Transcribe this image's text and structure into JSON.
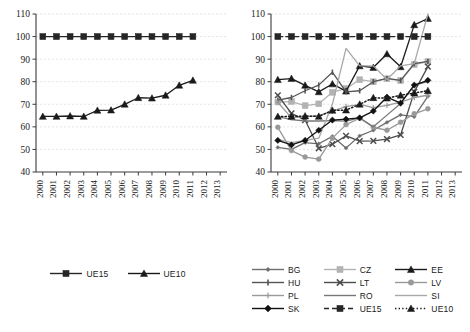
{
  "chart_data": [
    {
      "id": "left",
      "type": "line",
      "title": "",
      "xlabel": "",
      "ylabel": "",
      "x": [
        "2000",
        "2001",
        "2002",
        "2003",
        "2004",
        "2005",
        "2006",
        "2007",
        "2008",
        "2009",
        "2010",
        "2011",
        "2012",
        "2013"
      ],
      "xlim": [
        2000,
        2013
      ],
      "ylim": [
        40,
        110
      ],
      "yticks": [
        40,
        50,
        60,
        70,
        80,
        90,
        100,
        110
      ],
      "grid": true,
      "legend_position": "bottom",
      "series": [
        {
          "name": "UE15",
          "marker": "square",
          "color": "#262626",
          "dash": "solid",
          "values": [
            100,
            100,
            100,
            100,
            100,
            100,
            100,
            100,
            100,
            100,
            100,
            100,
            null,
            null
          ]
        },
        {
          "name": "UE10",
          "marker": "triangle",
          "color": "#1a1a1a",
          "dash": "solid",
          "values": [
            64.6,
            64.6,
            64.8,
            64.6,
            67.3,
            67.4,
            70.0,
            72.9,
            72.7,
            74.0,
            78.4,
            80.6,
            null,
            null
          ]
        }
      ]
    },
    {
      "id": "right",
      "type": "line",
      "title": "",
      "xlabel": "",
      "ylabel": "",
      "x": [
        "2000",
        "2001",
        "2002",
        "2003",
        "2004",
        "2005",
        "2006",
        "2007",
        "2008",
        "2009",
        "2010",
        "2011",
        "2012",
        "2013"
      ],
      "xlim": [
        2000,
        2013
      ],
      "ylim": [
        40,
        110
      ],
      "yticks": [
        40,
        50,
        60,
        70,
        80,
        90,
        100,
        110
      ],
      "grid": true,
      "legend_position": "bottom",
      "series": [
        {
          "name": "BG",
          "marker": "diamond-small",
          "color": "#6e6e6e",
          "dash": "solid",
          "values": [
            50.9,
            50.0,
            53.0,
            52.5,
            55.8,
            50.6,
            56.0,
            58.5,
            62.0,
            65.3,
            64.5,
            73.5,
            null,
            null
          ]
        },
        {
          "name": "CZ",
          "marker": "square",
          "color": "#b3b3b3",
          "dash": "solid",
          "values": [
            71.0,
            71.2,
            69.4,
            70.2,
            75.3,
            77.0,
            80.9,
            80.0,
            81.3,
            80.5,
            87.6,
            88.9,
            null,
            null
          ]
        },
        {
          "name": "EE",
          "marker": "triangle",
          "color": "#1a1a1a",
          "dash": "solid",
          "values": [
            80.9,
            81.4,
            78.4,
            75.5,
            79.0,
            75.8,
            87.0,
            86.3,
            92.3,
            86.6,
            105.2,
            108.0,
            null,
            null
          ]
        },
        {
          "name": "HU",
          "marker": "bar",
          "color": "#555555",
          "dash": "solid",
          "values": [
            71.8,
            73.0,
            76.0,
            78.5,
            84.2,
            75.5,
            76.0,
            80.0,
            81.5,
            80.6,
            88.0,
            89.0,
            null,
            null
          ]
        },
        {
          "name": "LT",
          "marker": "x",
          "color": "#4d4d4d",
          "dash": "solid",
          "values": [
            74.0,
            66.0,
            63.0,
            50.5,
            52.3,
            56.0,
            53.7,
            53.8,
            54.6,
            56.4,
            75.5,
            86.7,
            null,
            null
          ]
        },
        {
          "name": "LV",
          "marker": "circle",
          "color": "#999999",
          "dash": "solid",
          "values": [
            59.8,
            49.5,
            46.6,
            45.7,
            55.0,
            61.0,
            63.8,
            59.8,
            58.5,
            62.0,
            65.8,
            68.0,
            null,
            null
          ]
        },
        {
          "name": "PL",
          "marker": "plus",
          "color": "#9a9a9a",
          "dash": "solid",
          "values": [
            70.9,
            64.0,
            64.5,
            65.0,
            67.0,
            69.0,
            70.0,
            68.5,
            69.5,
            71.0,
            73.0,
            74.0,
            null,
            null
          ]
        },
        {
          "name": "RO",
          "marker": "none",
          "color": "#777777",
          "dash": "solid",
          "values": [
            64.5,
            63.2,
            62.6,
            62.6,
            62.8,
            62.5,
            64.0,
            60.0,
            65.2,
            70.3,
            78.5,
            80.0,
            null,
            null
          ]
        },
        {
          "name": "SI",
          "marker": "none",
          "color": "#a8a8a8",
          "dash": "solid",
          "values": [
            54.5,
            53.0,
            54.0,
            55.0,
            70.0,
            94.8,
            87.0,
            87.0,
            81.0,
            87.0,
            88.0,
            110.0,
            null,
            null
          ]
        },
        {
          "name": "SK",
          "marker": "diamond",
          "color": "#111111",
          "dash": "solid",
          "values": [
            54.0,
            52.0,
            54.0,
            58.5,
            63.0,
            63.4,
            64.0,
            67.0,
            73.2,
            70.5,
            78.5,
            80.6,
            null,
            null
          ]
        },
        {
          "name": "UE15",
          "marker": "square",
          "color": "#262626",
          "dash": "dashed",
          "values": [
            100,
            100,
            100,
            100,
            100,
            100,
            100,
            100,
            100,
            100,
            100,
            100,
            null,
            null
          ]
        },
        {
          "name": "UE10",
          "marker": "triangle",
          "color": "#1a1a1a",
          "dash": "dotted",
          "values": [
            64.6,
            64.6,
            64.8,
            64.6,
            67.3,
            67.4,
            70.0,
            72.9,
            72.7,
            74.0,
            75.0,
            76.0,
            null,
            null
          ]
        }
      ]
    }
  ],
  "left_panel": {
    "legend": [
      {
        "label": "UE15",
        "marker": "square",
        "color": "#262626",
        "dash": "solid"
      },
      {
        "label": "UE10",
        "marker": "triangle",
        "color": "#1a1a1a",
        "dash": "solid"
      }
    ]
  },
  "right_panel": {
    "legend": [
      {
        "label": "BG",
        "marker": "diamond-small",
        "color": "#6e6e6e",
        "dash": "solid"
      },
      {
        "label": "CZ",
        "marker": "square",
        "color": "#b3b3b3",
        "dash": "solid"
      },
      {
        "label": "EE",
        "marker": "triangle",
        "color": "#1a1a1a",
        "dash": "solid"
      },
      {
        "label": "HU",
        "marker": "bar",
        "color": "#555555",
        "dash": "solid"
      },
      {
        "label": "LT",
        "marker": "x",
        "color": "#4d4d4d",
        "dash": "solid"
      },
      {
        "label": "LV",
        "marker": "circle",
        "color": "#999999",
        "dash": "solid"
      },
      {
        "label": "PL",
        "marker": "plus",
        "color": "#9a9a9a",
        "dash": "solid"
      },
      {
        "label": "RO",
        "marker": "none",
        "color": "#777777",
        "dash": "solid"
      },
      {
        "label": "SI",
        "marker": "none",
        "color": "#a8a8a8",
        "dash": "solid"
      },
      {
        "label": "SK",
        "marker": "diamond",
        "color": "#111111",
        "dash": "solid"
      },
      {
        "label": "UE15",
        "marker": "square",
        "color": "#262626",
        "dash": "dashed"
      },
      {
        "label": "UE10",
        "marker": "triangle",
        "color": "#1a1a1a",
        "dash": "dotted"
      }
    ]
  },
  "colors": {
    "axis": "#3b3b3b",
    "grid": "#d8d8d8",
    "text": "#1a1a1a",
    "background": "#ffffff"
  }
}
